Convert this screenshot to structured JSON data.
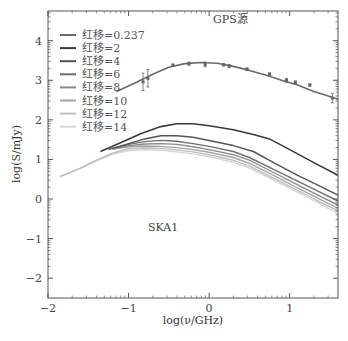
{
  "chart_data": {
    "type": "line",
    "title": "GPS源",
    "annotations": [
      {
        "text": "GPS源",
        "x": 0.05,
        "y": 4.45
      },
      {
        "text": "SKA1",
        "x": -0.5,
        "y": -0.75
      }
    ],
    "xlabel": "log(ν/GHz)",
    "ylabel": "log(S/mJy)",
    "xlim": [
      -2,
      1.6
    ],
    "ylim": [
      -2.5,
      4.75
    ],
    "xticks": [
      -2,
      -1,
      0,
      1
    ],
    "xtick_labels": [
      "−2",
      "−1",
      "0",
      "1"
    ],
    "yticks": [
      -2,
      -1,
      0,
      1,
      2,
      3,
      4
    ],
    "ytick_labels": [
      "−2",
      "−1",
      "0",
      "1",
      "2",
      "3",
      "4"
    ],
    "grid": false,
    "legend_position": "upper left",
    "series": [
      {
        "name": "红移=0.237",
        "color": "#6a6a6a",
        "width": 1.6,
        "x": [
          -1.15,
          -0.9,
          -0.7,
          -0.5,
          -0.3,
          -0.1,
          0.1,
          0.3,
          0.5,
          0.7,
          0.9,
          1.1,
          1.3,
          1.45,
          1.6
        ],
        "y": [
          2.72,
          2.95,
          3.15,
          3.33,
          3.42,
          3.45,
          3.43,
          3.35,
          3.25,
          3.13,
          3.0,
          2.88,
          2.72,
          2.62,
          2.52
        ]
      },
      {
        "name": "红移=2",
        "color": "#3a3a3a",
        "width": 1.6,
        "x": [
          -1.35,
          -1.1,
          -0.85,
          -0.6,
          -0.4,
          -0.2,
          0.0,
          0.3,
          0.55,
          0.75,
          1.0,
          1.3,
          1.6
        ],
        "y": [
          1.2,
          1.42,
          1.65,
          1.83,
          1.9,
          1.9,
          1.85,
          1.75,
          1.63,
          1.52,
          1.25,
          0.92,
          0.6
        ]
      },
      {
        "name": "红移=4",
        "color": "#555555",
        "width": 1.5,
        "x": [
          -1.25,
          -1.0,
          -0.8,
          -0.6,
          -0.4,
          -0.2,
          0.0,
          0.3,
          0.55,
          0.8,
          1.1,
          1.35,
          1.6
        ],
        "y": [
          1.25,
          1.4,
          1.52,
          1.6,
          1.6,
          1.56,
          1.48,
          1.35,
          1.2,
          0.92,
          0.6,
          0.35,
          0.1
        ]
      },
      {
        "name": "红移=6",
        "color": "#6f6f6f",
        "width": 1.4,
        "x": [
          -1.2,
          -1.0,
          -0.8,
          -0.6,
          -0.4,
          -0.2,
          0.0,
          0.3,
          0.5,
          0.8,
          1.1,
          1.35,
          1.6
        ],
        "y": [
          1.28,
          1.38,
          1.45,
          1.48,
          1.46,
          1.4,
          1.33,
          1.2,
          1.05,
          0.75,
          0.45,
          0.2,
          -0.05
        ]
      },
      {
        "name": "红移=8",
        "color": "#8a8a8a",
        "width": 1.4,
        "x": [
          -1.2,
          -1.0,
          -0.8,
          -0.6,
          -0.4,
          -0.2,
          0.0,
          0.3,
          0.5,
          0.8,
          1.1,
          1.35,
          1.6
        ],
        "y": [
          1.27,
          1.35,
          1.39,
          1.4,
          1.38,
          1.32,
          1.25,
          1.12,
          0.98,
          0.67,
          0.36,
          0.1,
          -0.15
        ]
      },
      {
        "name": "红移=10",
        "color": "#a2a2a2",
        "width": 1.4,
        "x": [
          -1.2,
          -1.0,
          -0.8,
          -0.6,
          -0.4,
          -0.2,
          0.0,
          0.3,
          0.5,
          0.8,
          1.1,
          1.35,
          1.6
        ],
        "y": [
          1.26,
          1.32,
          1.34,
          1.33,
          1.3,
          1.25,
          1.18,
          1.05,
          0.9,
          0.6,
          0.28,
          0.02,
          -0.24
        ]
      },
      {
        "name": "红移=12",
        "color": "#bdbdbd",
        "width": 1.4,
        "x": [
          -1.85,
          -1.6,
          -1.4,
          -1.2,
          -1.0,
          -0.8,
          -0.6,
          -0.4,
          -0.2,
          0.0,
          0.3,
          0.5,
          0.8,
          1.1,
          1.35,
          1.6
        ],
        "y": [
          0.57,
          0.78,
          0.98,
          1.16,
          1.27,
          1.29,
          1.28,
          1.24,
          1.19,
          1.12,
          0.98,
          0.83,
          0.53,
          0.22,
          -0.05,
          -0.3
        ]
      },
      {
        "name": "红移=14",
        "color": "#d6d6d6",
        "width": 1.4,
        "x": [
          -1.85,
          -1.6,
          -1.4,
          -1.2,
          -1.0,
          -0.8,
          -0.6,
          -0.4,
          -0.2,
          0.0,
          0.3,
          0.5,
          0.8,
          1.1,
          1.35,
          1.6
        ],
        "y": [
          0.56,
          0.77,
          0.96,
          1.13,
          1.22,
          1.24,
          1.23,
          1.19,
          1.14,
          1.07,
          0.93,
          0.78,
          0.48,
          0.17,
          -0.1,
          -0.36
        ]
      }
    ],
    "observed_points": {
      "name": "GPS observed data",
      "color": "#666666",
      "x": [
        -0.82,
        -0.76,
        -0.45,
        -0.25,
        -0.05,
        0.18,
        0.25,
        0.47,
        0.75,
        0.96,
        1.07,
        1.25,
        1.53
      ],
      "y": [
        2.96,
        3.05,
        3.38,
        3.42,
        3.4,
        3.39,
        3.36,
        3.28,
        3.15,
        3.0,
        2.95,
        2.88,
        2.55
      ],
      "err": [
        0.22,
        0.22,
        0.03,
        0.04,
        0.06,
        0.03,
        0.04,
        0.03,
        0.04,
        0.05,
        0.03,
        0.03,
        0.12
      ]
    }
  },
  "legend": [
    {
      "label": "红移=0.237"
    },
    {
      "label": "红移=2"
    },
    {
      "label": "红移=4"
    },
    {
      "label": "红移=6"
    },
    {
      "label": "红移=8"
    },
    {
      "label": "红移=10"
    },
    {
      "label": "红移=12"
    },
    {
      "label": "红移=14"
    }
  ],
  "labels": {
    "annotation_gps": "GPS源",
    "annotation_ska": "SKA1",
    "xlabel": "log(ν/GHz)",
    "ylabel": "log(S/mJy)"
  }
}
